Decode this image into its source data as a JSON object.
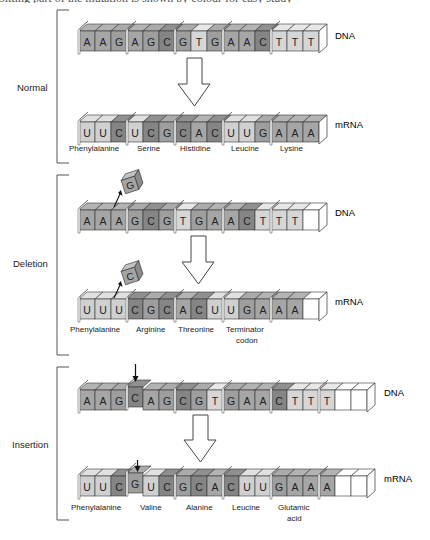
{
  "header": {
    "cut_off_text": "sitting part of the mutation is shown by colour for easy study"
  },
  "colors": {
    "A": "#a6a6a6",
    "G": "#9e9e9e",
    "C": "#858585",
    "T": "#d6d6d6",
    "U": "#d0d0d0",
    "empty": "#ffffff",
    "outline": "#333333",
    "bracket": "#555555"
  },
  "labels": {
    "dna": "DNA",
    "mrna": "mRNA"
  },
  "sections": [
    {
      "name": "Normal",
      "dna": [
        "A",
        "A",
        "G",
        "A",
        "G",
        "C",
        "G",
        "T",
        "G",
        "A",
        "A",
        "C",
        "T",
        "T",
        "T"
      ],
      "mrna": [
        "U",
        "U",
        "C",
        "U",
        "C",
        "G",
        "C",
        "A",
        "C",
        "U",
        "U",
        "G",
        "A",
        "A",
        "A"
      ],
      "amino_acids": [
        "Phenylalanine",
        "Serine",
        "Histidine",
        "Leucine",
        "Lysine"
      ]
    },
    {
      "name": "Deletion",
      "dna": [
        "A",
        "A",
        "A",
        "G",
        "C",
        "G",
        "T",
        "G",
        "A",
        "A",
        "C",
        "T",
        "T",
        "T",
        ""
      ],
      "mrna": [
        "U",
        "U",
        "U",
        "C",
        "G",
        "C",
        "A",
        "C",
        "U",
        "U",
        "G",
        "A",
        "A",
        "A",
        ""
      ],
      "removed_dna_base": "G",
      "removed_mrna_base": "C",
      "amino_acids": [
        "Phenylalanine",
        "Arginine",
        "Threonine",
        "Terminator codon"
      ]
    },
    {
      "name": "Insertion",
      "dna": [
        "A",
        "A",
        "G",
        "C",
        "A",
        "G",
        "C",
        "G",
        "T",
        "G",
        "A",
        "A",
        "C",
        "T",
        "T",
        "T",
        "",
        ""
      ],
      "mrna": [
        "U",
        "U",
        "C",
        "G",
        "U",
        "C",
        "G",
        "C",
        "A",
        "C",
        "U",
        "U",
        "G",
        "A",
        "A",
        "A",
        "",
        ""
      ],
      "inserted_index": 3,
      "amino_acids": [
        "Phenylalanine",
        "Valine",
        "Alanine",
        "Leucine",
        "Glutamic acid"
      ]
    }
  ]
}
